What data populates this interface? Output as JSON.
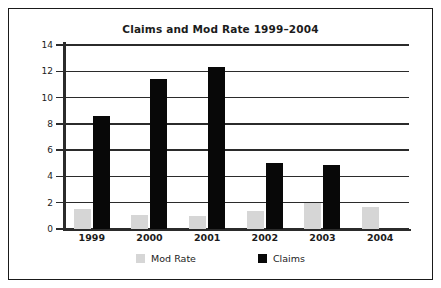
{
  "chart_data": {
    "type": "bar",
    "title": "Claims and Mod Rate 1999–2004",
    "xlabel": "",
    "ylabel": "",
    "categories": [
      "1999",
      "2000",
      "2001",
      "2002",
      "2003",
      "2004"
    ],
    "series": [
      {
        "name": "Mod Rate",
        "color": "#d6d6d6",
        "values": [
          1.5,
          1.1,
          1.0,
          1.4,
          2.0,
          1.7
        ]
      },
      {
        "name": "Claims",
        "color": "#080808",
        "values": [
          8.6,
          11.4,
          12.3,
          5.0,
          4.9,
          0
        ]
      }
    ],
    "ylim": [
      0,
      14
    ],
    "yticks": [
      0,
      2,
      4,
      6,
      8,
      10,
      12,
      14
    ],
    "ytick_labels": [
      "0",
      "2",
      "4",
      "6",
      "8",
      "10",
      "12",
      "14"
    ],
    "grid": true,
    "legend_position": "bottom"
  },
  "legend": {
    "items": [
      {
        "label": "Mod Rate"
      },
      {
        "label": "Claims"
      }
    ]
  }
}
